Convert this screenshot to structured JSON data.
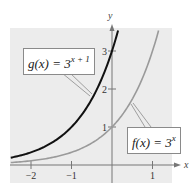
{
  "chart_data": {
    "type": "line",
    "title": "",
    "xlabel": "x",
    "ylabel": "y",
    "xlim": [
      -2.5,
      1.5
    ],
    "ylim": [
      -0.45,
      3.6
    ],
    "grid": false,
    "background_color": "#ececec",
    "x_ticks": [
      -2,
      -1,
      1
    ],
    "x_tick_labels": [
      "−2",
      "−1",
      "1"
    ],
    "y_ticks": [
      1,
      2,
      3
    ],
    "y_tick_labels": [
      "1",
      "2",
      "3"
    ],
    "series": [
      {
        "name": "g(x) = 3^(x + 1)",
        "label_base": "g(x) = 3",
        "label_exp": "x + 1",
        "color": "#111111",
        "x": [
          -2.5,
          -2,
          -1.5,
          -1,
          -0.5,
          0,
          0.15
        ],
        "y": [
          0.19,
          0.33,
          0.58,
          1.0,
          1.73,
          3.0,
          3.53
        ]
      },
      {
        "name": "f(x) = 3^x",
        "label_base": "f(x) = 3",
        "label_exp": "x",
        "color": "#9a9a9a",
        "x": [
          -2.5,
          -2,
          -1,
          0,
          0.5,
          1,
          1.15
        ],
        "y": [
          0.06,
          0.11,
          0.33,
          1.0,
          1.73,
          3.0,
          3.54
        ]
      }
    ]
  }
}
